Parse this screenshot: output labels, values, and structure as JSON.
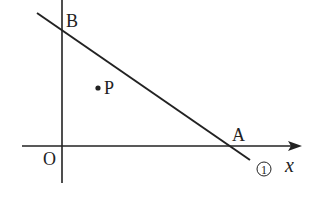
{
  "diagram": {
    "labels": {
      "B": "B",
      "P": "P",
      "O": "O",
      "A": "A",
      "line_id": "①",
      "x_axis": "x"
    },
    "colors": {
      "stroke": "#222222",
      "background": "#ffffff"
    }
  }
}
